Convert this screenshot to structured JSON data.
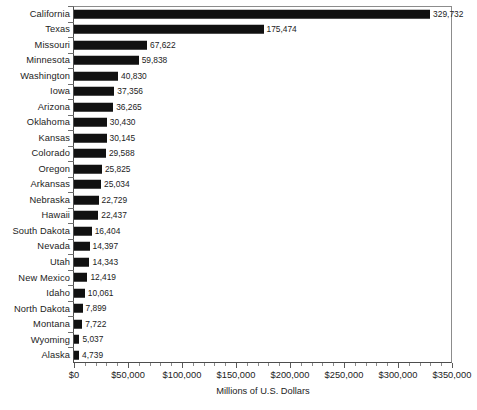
{
  "chart_data": {
    "type": "bar",
    "orientation": "horizontal",
    "title": "",
    "subtitle": "",
    "xlabel": "Millions of U.S. Dollars",
    "ylabel": "",
    "xlim": [
      0,
      350000
    ],
    "xtick_labels": [
      "$0",
      "$50,000",
      "$100,000",
      "$150,000",
      "$200,000",
      "$250,000",
      "$300,000",
      "$350,000"
    ],
    "xtick_values": [
      0,
      50000,
      100000,
      150000,
      200000,
      250000,
      300000,
      350000
    ],
    "xtick_step": 50000,
    "minor_ticks_per_interval": 5,
    "grid": false,
    "legend": false,
    "legend_position": "none",
    "bar_color": "#111111",
    "axis_color": "#4d4d4d",
    "categories": [
      "California",
      "Texas",
      "Missouri",
      "Minnesota",
      "Washington",
      "Iowa",
      "Arizona",
      "Oklahoma",
      "Kansas",
      "Colorado",
      "Oregon",
      "Arkansas",
      "Nebraska",
      "Hawaii",
      "South Dakota",
      "Nevada",
      "Utah",
      "New Mexico",
      "Idaho",
      "North Dakota",
      "Montana",
      "Wyoming",
      "Alaska"
    ],
    "values": [
      329732,
      175474,
      67622,
      59838,
      40830,
      37356,
      36265,
      30430,
      30145,
      29588,
      25825,
      25034,
      22729,
      22437,
      16404,
      14397,
      14343,
      12419,
      10061,
      7899,
      7722,
      5037,
      4739
    ],
    "value_labels": [
      "329,732",
      "175,474",
      "67,622",
      "59,838",
      "40,830",
      "37,356",
      "36,265",
      "30,430",
      "30,145",
      "29,588",
      "25,825",
      "25,034",
      "22,729",
      "22,437",
      "16,404",
      "14,397",
      "14,343",
      "12,419",
      "10,061",
      "7,899",
      "7,722",
      "5,037",
      "4,739"
    ]
  },
  "footnote": {
    "text": ""
  }
}
